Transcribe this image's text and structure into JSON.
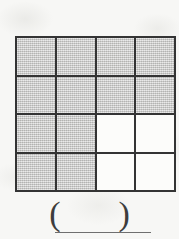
{
  "worksheet": {
    "figure_type": "shaded-fraction-grid",
    "background_color": "#f7f7f5",
    "grid": {
      "rows": 4,
      "columns": 4,
      "total_cells": 16,
      "shaded_cells": 12,
      "unshaded_cells": 4,
      "shaded_color": "#c9c9c7",
      "unshaded_color": "#fcfcfa",
      "line_color": "#343434",
      "cells": [
        [
          {
            "id": "r1c1",
            "state": "shaded"
          },
          {
            "id": "r1c2",
            "state": "shaded"
          },
          {
            "id": "r1c3",
            "state": "shaded"
          },
          {
            "id": "r1c4",
            "state": "shaded"
          }
        ],
        [
          {
            "id": "r2c1",
            "state": "shaded"
          },
          {
            "id": "r2c2",
            "state": "shaded"
          },
          {
            "id": "r2c3",
            "state": "shaded"
          },
          {
            "id": "r2c4",
            "state": "shaded"
          }
        ],
        [
          {
            "id": "r3c1",
            "state": "shaded"
          },
          {
            "id": "r3c2",
            "state": "shaded"
          },
          {
            "id": "r3c3",
            "state": "unshaded"
          },
          {
            "id": "r3c4",
            "state": "unshaded"
          }
        ],
        [
          {
            "id": "r4c1",
            "state": "shaded"
          },
          {
            "id": "r4c2",
            "state": "shaded"
          },
          {
            "id": "r4c3",
            "state": "unshaded"
          },
          {
            "id": "r4c4",
            "state": "unshaded"
          }
        ]
      ]
    },
    "answer": {
      "open_paren": "(",
      "close_paren": ")",
      "value": "",
      "placeholder": ""
    }
  }
}
